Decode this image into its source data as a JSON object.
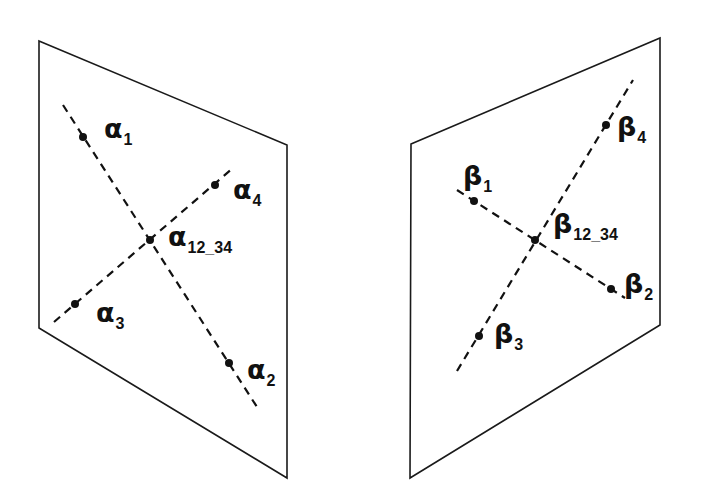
{
  "diagram": {
    "title": "",
    "colors": {
      "line": "#111111",
      "background": "#ffffff"
    },
    "planes": [
      {
        "id": "left-plane",
        "corners": [
          [
            39,
            41
          ],
          [
            287,
            145
          ],
          [
            287,
            478
          ],
          [
            39,
            328
          ]
        ],
        "lines": [
          {
            "from": [
              63,
              105
            ],
            "to": [
              257,
              407
            ]
          },
          {
            "from": [
              54,
              322
            ],
            "to": [
              233,
              168
            ]
          }
        ],
        "points": [
          {
            "symbol": "α",
            "sub": "1",
            "pos": [
              83,
              137
            ],
            "label_pos": [
              104,
              117
            ]
          },
          {
            "symbol": "α",
            "sub": "2",
            "pos": [
              229,
              363
            ],
            "label_pos": [
              247,
              358
            ]
          },
          {
            "symbol": "α",
            "sub": "3",
            "pos": [
              75,
              304
            ],
            "label_pos": [
              96,
              300
            ]
          },
          {
            "symbol": "α",
            "sub": "4",
            "pos": [
              215,
              185
            ],
            "label_pos": [
              234,
              178
            ]
          },
          {
            "symbol": "α",
            "sub": "12_34",
            "pos": [
              150,
              240
            ],
            "label_pos": [
              168,
              225
            ]
          }
        ]
      },
      {
        "id": "right-plane",
        "corners": [
          [
            411,
            144
          ],
          [
            660,
            38
          ],
          [
            660,
            325
          ],
          [
            410,
            478
          ]
        ],
        "lines": [
          {
            "from": [
              457,
              190
            ],
            "to": [
              625,
              298
            ]
          },
          {
            "from": [
              457,
              371
            ],
            "to": [
              633,
              80
            ]
          }
        ],
        "points": [
          {
            "symbol": "β",
            "sub": "1",
            "pos": [
              474,
              201
            ],
            "label_pos": [
              463,
              164
            ]
          },
          {
            "symbol": "β",
            "sub": "2",
            "pos": [
              611,
              289
            ],
            "label_pos": [
              625,
              272
            ]
          },
          {
            "symbol": "β",
            "sub": "3",
            "pos": [
              479,
              336
            ],
            "label_pos": [
              494,
              322
            ]
          },
          {
            "symbol": "β",
            "sub": "4",
            "pos": [
              606,
              125
            ],
            "label_pos": [
              618,
              115
            ]
          },
          {
            "symbol": "β",
            "sub": "12_34",
            "pos": [
              535,
              240
            ],
            "label_pos": [
              553,
              212
            ]
          }
        ]
      }
    ]
  },
  "labels": {
    "a1": {
      "symbol": "α",
      "sub": "1"
    },
    "a2": {
      "symbol": "α",
      "sub": "2"
    },
    "a3": {
      "symbol": "α",
      "sub": "3"
    },
    "a4": {
      "symbol": "α",
      "sub": "4"
    },
    "a1234": {
      "symbol": "α",
      "sub": "12_34"
    },
    "b1": {
      "symbol": "β",
      "sub": "1"
    },
    "b2": {
      "symbol": "β",
      "sub": "2"
    },
    "b3": {
      "symbol": "β",
      "sub": "3"
    },
    "b4": {
      "symbol": "β",
      "sub": "4"
    },
    "b1234": {
      "symbol": "β",
      "sub": "12_34"
    }
  }
}
